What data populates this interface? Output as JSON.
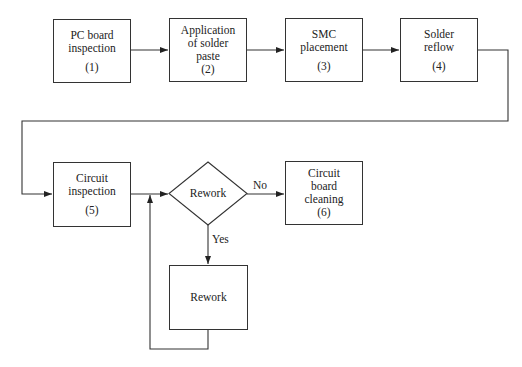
{
  "diagram": {
    "type": "flowchart",
    "nodes": [
      {
        "id": "1",
        "lines": [
          "PC board",
          "inspection"
        ],
        "num": "(1)"
      },
      {
        "id": "2",
        "lines": [
          "Application",
          "of solder",
          "paste"
        ],
        "num": "(2)"
      },
      {
        "id": "3",
        "lines": [
          "SMC",
          "placement"
        ],
        "num": "(3)"
      },
      {
        "id": "4",
        "lines": [
          "Solder",
          "reflow"
        ],
        "num": "(4)"
      },
      {
        "id": "5",
        "lines": [
          "Circuit",
          "inspection"
        ],
        "num": "(5)"
      },
      {
        "id": "decision",
        "shape": "diamond",
        "label": "Rework"
      },
      {
        "id": "6",
        "lines": [
          "Circuit",
          "board",
          "cleaning"
        ],
        "num": "(6)"
      },
      {
        "id": "rework",
        "lines": [
          "Rework"
        ]
      }
    ],
    "edges": [
      {
        "from": "1",
        "to": "2"
      },
      {
        "from": "2",
        "to": "3"
      },
      {
        "from": "3",
        "to": "4"
      },
      {
        "from": "4",
        "to": "5"
      },
      {
        "from": "5",
        "to": "decision"
      },
      {
        "from": "decision",
        "to": "6",
        "label": "No"
      },
      {
        "from": "decision",
        "to": "rework",
        "label": "Yes"
      },
      {
        "from": "rework",
        "to": "decision"
      }
    ],
    "edge_labels": {
      "no": "No",
      "yes": "Yes"
    }
  }
}
